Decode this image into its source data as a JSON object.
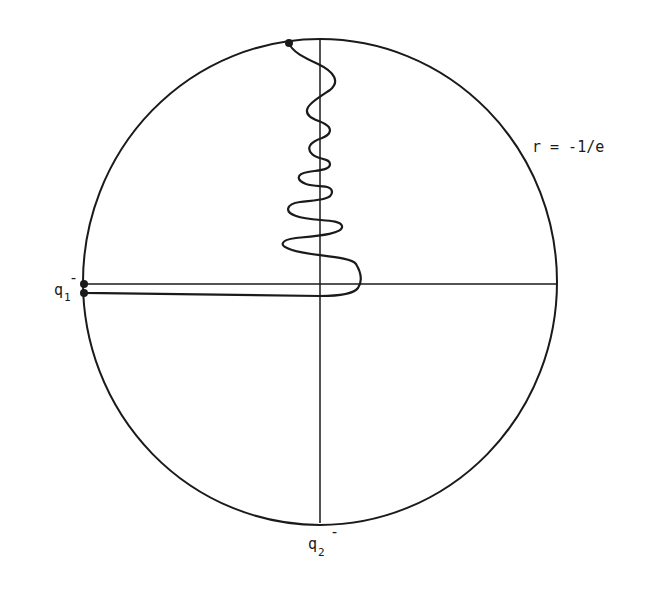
{
  "figure": {
    "type": "phase-plane diagram",
    "boundary_label": "r = -1/e",
    "points": {
      "q1": {
        "symbol": "q",
        "subscript": "1",
        "superscript": "-"
      },
      "q2": {
        "symbol": "q",
        "subscript": "2",
        "superscript": "-"
      }
    },
    "colors": {
      "ink": "#1a1a1a",
      "background": "#ffffff"
    }
  }
}
